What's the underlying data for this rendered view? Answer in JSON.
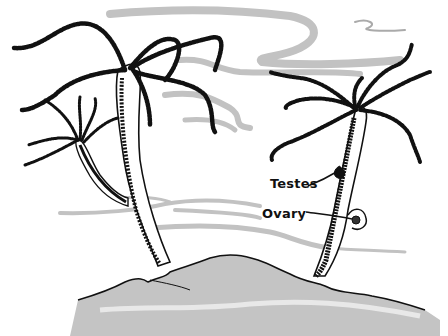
{
  "diagram": {
    "labels": [
      {
        "id": "testes",
        "text": "Testes",
        "x": 270,
        "y": 176
      },
      {
        "id": "ovary",
        "text": "Ovary",
        "x": 262,
        "y": 207
      }
    ],
    "colors": {
      "ink": "#111111",
      "shadow": "#b8b8b8",
      "background": "#ffffff"
    }
  }
}
